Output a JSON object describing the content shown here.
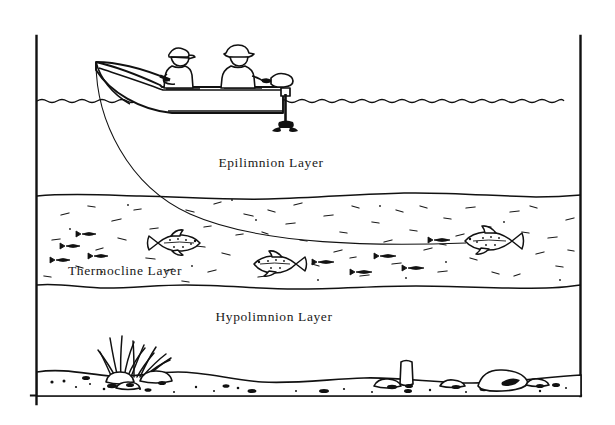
{
  "figure": {
    "title_visible": false,
    "background_color": "#ffffff",
    "ink_color": "#111111",
    "border": {
      "left_x": 36,
      "right_x": 581,
      "top_y": 36,
      "bottom_y": 396,
      "style": "open-frame-left-right-bottom"
    }
  },
  "labels": {
    "epilimnion": "Epilimnion Layer",
    "thermocline": "Thermocline Layer",
    "hypolimnion": "Hypolimnion Layer"
  },
  "label_positions": {
    "epilimnion": {
      "x": 271,
      "y": 167
    },
    "thermocline": {
      "x": 125,
      "y": 275
    },
    "hypolimnion": {
      "x": 274,
      "y": 321
    }
  },
  "layers": [
    {
      "name": "epilimnion",
      "label": "Epilimnion Layer",
      "top_boundary": "water-surface",
      "top_y": 101,
      "bottom_y": 196,
      "fill": "#ffffff",
      "texture": "none"
    },
    {
      "name": "thermocline",
      "label": "Thermocline Layer",
      "top_y": 196,
      "bottom_y": 288,
      "fill": "#ffffff",
      "texture": "stippled-dashes"
    },
    {
      "name": "hypolimnion",
      "label": "Hypolimnion Layer",
      "top_y": 288,
      "bottom_y": 396,
      "fill": "#ffffff",
      "texture": "none"
    }
  ],
  "scene": {
    "water_surface_y": 101,
    "boat": {
      "name": "fishing-boat",
      "bow_x": 96,
      "stern_x": 283,
      "gunwale_y": 86,
      "hull_bottom_y": 113,
      "anglers": 2
    },
    "anglers": [
      {
        "name": "angler-front",
        "headwear": "cap",
        "x": 178,
        "y": 60,
        "holding": "fishing-rod"
      },
      {
        "name": "angler-rear",
        "headwear": "hat",
        "x": 238,
        "y": 56,
        "holding": "tiller"
      }
    ],
    "outboard_motor": {
      "name": "outboard-motor",
      "x": 286,
      "top_y": 80,
      "prop_y": 128
    },
    "fishing_rod": {
      "tip_x": 96,
      "tip_y": 63,
      "butt_x": 172,
      "butt_y": 78,
      "bent": true
    },
    "fishing_line": {
      "from": {
        "x": 96,
        "y": 63
      },
      "to": {
        "x": 466,
        "y": 243
      },
      "hooked_fish": "gamefish-right"
    },
    "fish": [
      {
        "name": "gamefish-left",
        "x": 177,
        "y": 243,
        "length": 44,
        "facing": "right",
        "style": "trout"
      },
      {
        "name": "gamefish-center",
        "x": 276,
        "y": 264,
        "length": 40,
        "facing": "left",
        "style": "bass"
      },
      {
        "name": "gamefish-right",
        "x": 489,
        "y": 241,
        "length": 48,
        "facing": "left",
        "style": "trout"
      }
    ],
    "baitfish_count": 9,
    "bottom": {
      "name": "lake-bottom",
      "substrate": "sand-and-gravel",
      "vegetation": {
        "name": "aquatic-weeds",
        "x": 122,
        "base_y": 378,
        "blade_count": 13
      },
      "rocks": [
        {
          "x": 118,
          "y": 375,
          "w": 26,
          "h": 14
        },
        {
          "x": 155,
          "y": 373,
          "w": 30,
          "h": 15
        },
        {
          "x": 404,
          "y": 372,
          "w": 13,
          "h": 22
        },
        {
          "x": 386,
          "y": 382,
          "w": 22,
          "h": 11
        },
        {
          "x": 452,
          "y": 381,
          "w": 20,
          "h": 10
        },
        {
          "x": 505,
          "y": 372,
          "w": 44,
          "h": 19
        }
      ]
    }
  }
}
